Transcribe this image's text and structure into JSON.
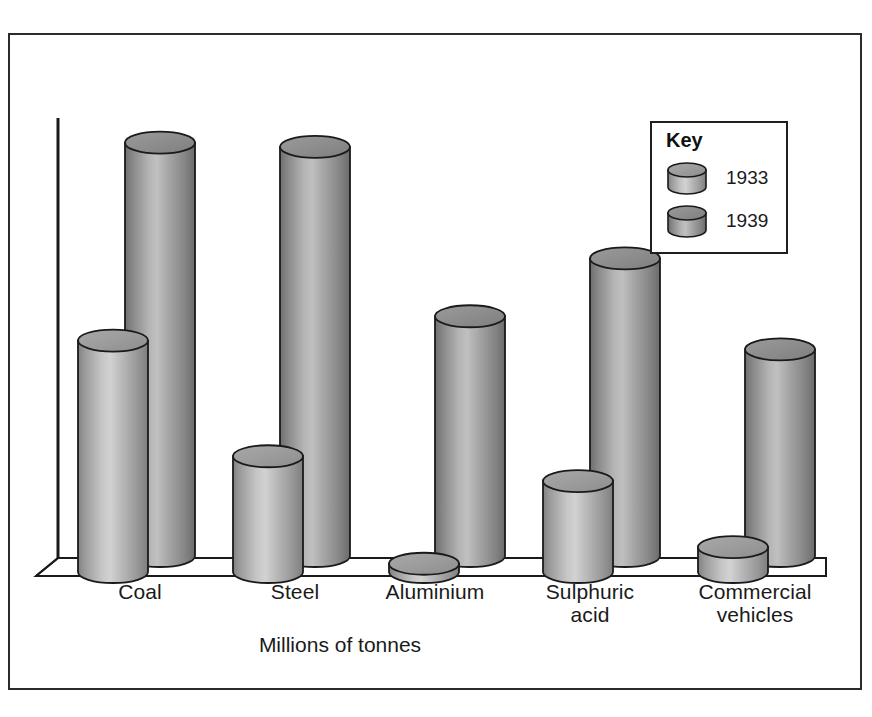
{
  "chart_data": {
    "type": "bar",
    "title": "",
    "subtitle": "",
    "xlabel": "Millions of tonnes",
    "ylabel": "",
    "categories": [
      "Coal",
      "Steel",
      "Aluminium",
      "Sulphuric\nacid",
      "Commercial\nvehicles"
    ],
    "series": [
      {
        "name": "1933",
        "values": [
          56,
          28,
          2,
          22,
          6
        ]
      },
      {
        "name": "1939",
        "values": [
          100,
          99,
          58,
          72,
          50
        ]
      }
    ],
    "ylim": [
      0,
      105
    ],
    "grid": false,
    "legend_position": "top-right",
    "legend_title": "Key",
    "style": "3d-cylinder"
  },
  "figure": {
    "axis_caption": "Millions of tonnes"
  },
  "legend": {
    "title": "Key",
    "entries": [
      {
        "label": "1933",
        "color": "#9a9a9a"
      },
      {
        "label": "1939",
        "color": "#838383"
      }
    ]
  },
  "categories": [
    {
      "label": "Coal"
    },
    {
      "label": "Steel"
    },
    {
      "label": "Aluminium"
    },
    {
      "label": "Sulphuric\nacid"
    },
    {
      "label": "Commercial\nvehicles"
    }
  ],
  "colors": {
    "frame": "#2b2b2b",
    "axis": "#1a1a1a",
    "bar_1933_light": "#c3c3c3",
    "bar_1933_dark": "#7d7d7d",
    "bar_1939_light": "#b2b2b2",
    "bar_1939_dark": "#6d6d6d",
    "background": "#ffffff",
    "text": "#1a1a1a"
  }
}
